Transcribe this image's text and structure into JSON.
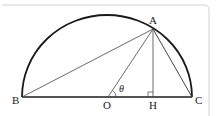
{
  "diagram": {
    "labels": {
      "A": "A",
      "B": "B",
      "O": "O",
      "H": "H",
      "C": "C",
      "theta": "θ"
    },
    "colors": {
      "stroke": "#1a1a1a",
      "thin_stroke": "#444444",
      "frame": "#cccccc"
    }
  }
}
